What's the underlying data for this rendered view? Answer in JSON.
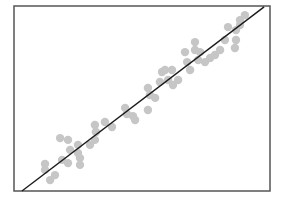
{
  "chart_data": {
    "type": "scatter",
    "title": "",
    "xlabel": "",
    "ylabel": "",
    "xlim": [
      0,
      100
    ],
    "ylim": [
      0,
      100
    ],
    "grid": false,
    "legend": null,
    "colors": {
      "points": "#c6c6c6",
      "line": "#1a1a1a",
      "frame": "#555555"
    },
    "series": [
      {
        "name": "observations",
        "points": [
          [
            12.1,
            14.6
          ],
          [
            12.1,
            11.4
          ],
          [
            14.1,
            5.9
          ],
          [
            16.0,
            8.6
          ],
          [
            18.0,
            28.6
          ],
          [
            21.1,
            27.6
          ],
          [
            18.8,
            16.8
          ],
          [
            21.1,
            15.1
          ],
          [
            21.9,
            22.2
          ],
          [
            25.0,
            24.9
          ],
          [
            25.0,
            20.5
          ],
          [
            25.8,
            14.1
          ],
          [
            25.8,
            17.8
          ],
          [
            29.7,
            24.9
          ],
          [
            31.6,
            27.6
          ],
          [
            31.6,
            35.7
          ],
          [
            32.0,
            31.9
          ],
          [
            35.5,
            37.3
          ],
          [
            38.3,
            34.6
          ],
          [
            43.4,
            44.9
          ],
          [
            44.1,
            41.6
          ],
          [
            46.5,
            40.5
          ],
          [
            47.3,
            38.4
          ],
          [
            52.3,
            43.8
          ],
          [
            52.3,
            55.7
          ],
          [
            53.1,
            51.9
          ],
          [
            55.1,
            50.3
          ],
          [
            57.0,
            58.9
          ],
          [
            57.8,
            64.3
          ],
          [
            59.0,
            65.4
          ],
          [
            61.7,
            65.4
          ],
          [
            60.2,
            60.0
          ],
          [
            62.1,
            57.3
          ],
          [
            64.1,
            60.0
          ],
          [
            66.8,
            75.1
          ],
          [
            67.6,
            69.7
          ],
          [
            68.8,
            65.4
          ],
          [
            70.7,
            80.5
          ],
          [
            70.7,
            76.2
          ],
          [
            71.9,
            70.8
          ],
          [
            72.7,
            75.1
          ],
          [
            74.6,
            69.7
          ],
          [
            76.6,
            71.9
          ],
          [
            78.5,
            73.5
          ],
          [
            80.5,
            76.2
          ],
          [
            82.4,
            81.6
          ],
          [
            86.3,
            77.3
          ],
          [
            86.7,
            81.6
          ],
          [
            88.3,
            92.4
          ],
          [
            88.3,
            89.7
          ],
          [
            86.7,
            87.0
          ],
          [
            90.2,
            95.1
          ],
          [
            83.6,
            88.6
          ]
        ]
      }
    ],
    "fit_line": {
      "x": [
        3.1,
        97.7
      ],
      "y": [
        0.0,
        99.5
      ]
    }
  }
}
